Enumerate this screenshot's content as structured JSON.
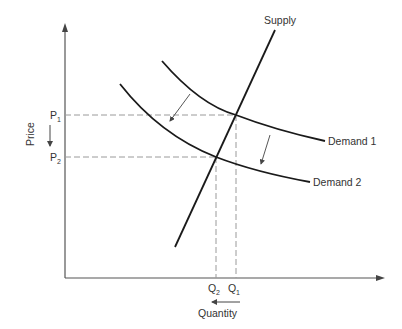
{
  "diagram": {
    "axes": {
      "x_label": "Quantity",
      "y_label": "Price"
    },
    "curves": {
      "supply": "Supply",
      "demand1": "Demand 1",
      "demand2": "Demand 2"
    },
    "price_ticks": {
      "p1_main": "P",
      "p1_sub": "1",
      "p2_main": "P",
      "p2_sub": "2"
    },
    "quantity_ticks": {
      "q1_main": "Q",
      "q1_sub": "1",
      "q2_main": "Q",
      "q2_sub": "2"
    },
    "annotations": {
      "price_arrow": "down",
      "quantity_arrow": "left",
      "shift_arrows": "Demand 1 shifts down-left to Demand 2"
    },
    "colors": {
      "line": "#1a1a1a",
      "axis": "#555555",
      "dashed": "#9a9a9a",
      "text": "#333333"
    }
  }
}
